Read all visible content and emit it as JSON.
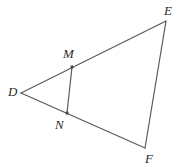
{
  "figure": {
    "kind": "geometry-diagram",
    "canvas": {
      "width": 182,
      "height": 167
    },
    "background_color": "#ffffff",
    "stroke_color": "#5a5a5a",
    "label_color": "#2b2b2b",
    "stroke_width": 1.2
  },
  "points": {
    "D": {
      "label": "D",
      "x": 21,
      "y": 93,
      "label_x": 8,
      "label_y": 85,
      "marker": false
    },
    "E": {
      "label": "E",
      "x": 166,
      "y": 21,
      "label_x": 164,
      "label_y": 4,
      "marker": false
    },
    "F": {
      "label": "F",
      "x": 145,
      "y": 148,
      "label_x": 145,
      "label_y": 152,
      "marker": false
    },
    "M": {
      "label": "M",
      "x": 72,
      "y": 67,
      "label_x": 63,
      "label_y": 47,
      "marker": true
    },
    "N": {
      "label": "N",
      "x": 67,
      "y": 113,
      "label_x": 55,
      "label_y": 118,
      "marker": true
    }
  },
  "segments": [
    {
      "name": "DE",
      "from": "D",
      "to": "E"
    },
    {
      "name": "EF",
      "from": "E",
      "to": "F"
    },
    {
      "name": "DF",
      "from": "D",
      "to": "F"
    },
    {
      "name": "MN",
      "from": "M",
      "to": "N"
    }
  ],
  "paths": {
    "DE": "M 21 93 L 166 21",
    "EF": "M 166 21 L 145 148",
    "DF": "M 21 93 L 145 148",
    "MN": "M 72 67 L 67 113"
  },
  "markers": {
    "M": {
      "cx": 72,
      "cy": 67,
      "r": 1.7
    },
    "N": {
      "cx": 67,
      "cy": 113,
      "r": 1.7
    }
  }
}
